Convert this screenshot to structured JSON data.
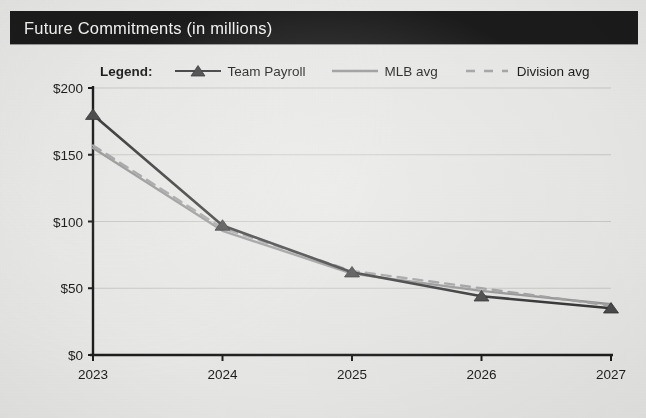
{
  "header": {
    "title": "Future Commitments (in millions)",
    "banner_color": "#1b1b1b",
    "text_color": "#f4f4f2"
  },
  "legend": {
    "title": "Legend:",
    "entries": [
      {
        "label": "Team Payroll",
        "marker": "triangle-line-marker",
        "color": "#3a3a3a",
        "style": "solid"
      },
      {
        "label": "MLB avg",
        "marker": "solid-line-swatch",
        "color": "#9a9a9a",
        "style": "solid"
      },
      {
        "label": "Division avg",
        "marker": "dashed-line-swatch",
        "color": "#a5a5a5",
        "style": "dashed"
      }
    ]
  },
  "chart_data": {
    "type": "line",
    "title": "Future Commitments (in millions)",
    "xlabel": "",
    "ylabel": "",
    "categories": [
      "2023",
      "2024",
      "2025",
      "2026",
      "2027"
    ],
    "x": [
      2023,
      2024,
      2025,
      2026,
      2027
    ],
    "ylim": [
      0,
      200
    ],
    "ytick_values": [
      0,
      50,
      100,
      150,
      200
    ],
    "ytick_labels": [
      "$0",
      "$50",
      "$100",
      "$150",
      "$200"
    ],
    "grid": true,
    "legend_position": "top",
    "series": [
      {
        "name": "Team Payroll",
        "color": "#3a3a3a",
        "style": "solid",
        "marker": "triangle",
        "values": [
          180,
          97,
          62,
          44,
          35
        ]
      },
      {
        "name": "MLB avg",
        "color": "#9a9a9a",
        "style": "solid",
        "marker": "none",
        "values": [
          155,
          93,
          61,
          48,
          38
        ]
      },
      {
        "name": "Division avg",
        "color": "#a5a5a5",
        "style": "dashed",
        "marker": "none",
        "values": [
          157,
          95,
          63,
          50,
          37
        ]
      }
    ]
  }
}
